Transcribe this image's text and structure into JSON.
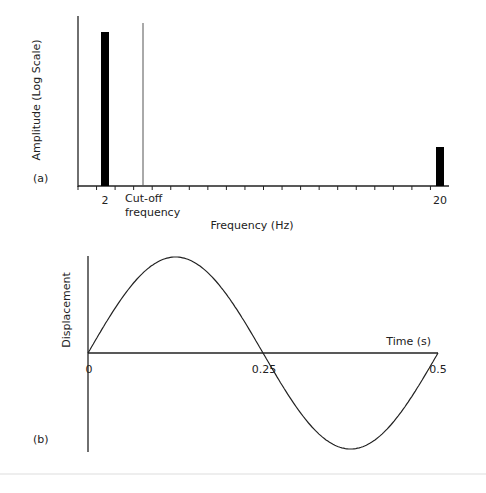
{
  "chart_data": [
    {
      "panel": "(a)",
      "type": "bar",
      "xlabel": "Frequency (Hz)",
      "ylabel": "Amplitude (Log Scale)",
      "categories": [
        "2",
        "20"
      ],
      "values": [
        0.92,
        0.23
      ],
      "x_tick_labels": [
        "2",
        "20"
      ],
      "annotations": [
        {
          "text": "Cut-off frequency",
          "type": "vertical-line"
        }
      ],
      "grid": false
    },
    {
      "panel": "(b)",
      "type": "line",
      "xlabel": "Time (s)",
      "ylabel": "Displacement",
      "x_tick_labels": [
        "0",
        "0.25",
        "0.5"
      ],
      "series": [
        {
          "name": "sine wave",
          "function": "sin(2*pi*2*t)",
          "x": [
            0,
            0.125,
            0.25,
            0.375,
            0.5
          ],
          "values": [
            0,
            1,
            0,
            -1,
            0
          ]
        }
      ],
      "xlim": [
        0,
        0.5
      ],
      "grid": false
    }
  ],
  "panel_a": {
    "label": "(a)",
    "ylabel": "Amplitude (Log Scale)",
    "xlabel": "Frequency (Hz)",
    "tick_2": "2",
    "tick_20": "20",
    "cutoff_line1": "Cut-off",
    "cutoff_line2": "frequency"
  },
  "panel_b": {
    "label": "(b)",
    "ylabel": "Displacement",
    "xlabel": "Time (s)",
    "tick_0": "0",
    "tick_025": "0.25",
    "tick_05": "0.5"
  }
}
